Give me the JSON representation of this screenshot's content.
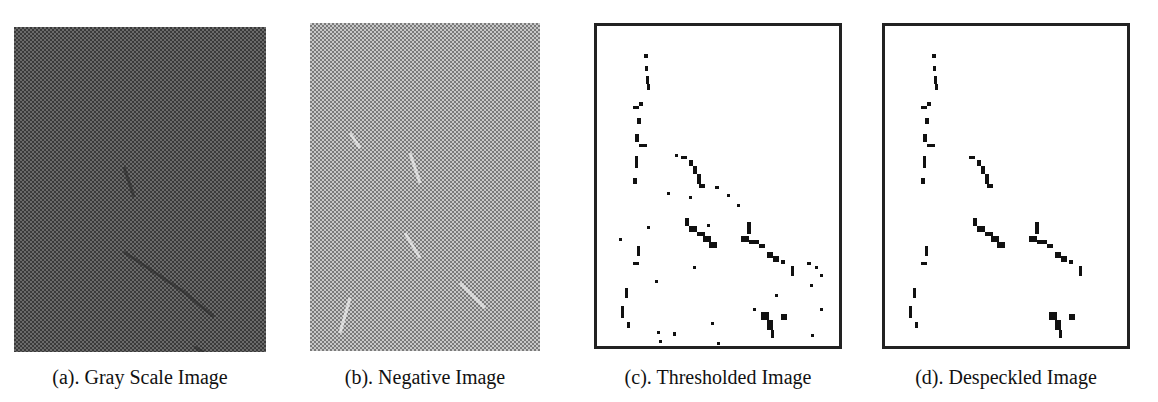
{
  "figure": {
    "panels": [
      {
        "id": "a",
        "caption": "(a). Gray Scale Image"
      },
      {
        "id": "b",
        "caption": "(b). Negative Image"
      },
      {
        "id": "c",
        "caption": "(c). Thresholded Image"
      },
      {
        "id": "d",
        "caption": "(d). Despeckled Image"
      }
    ]
  }
}
